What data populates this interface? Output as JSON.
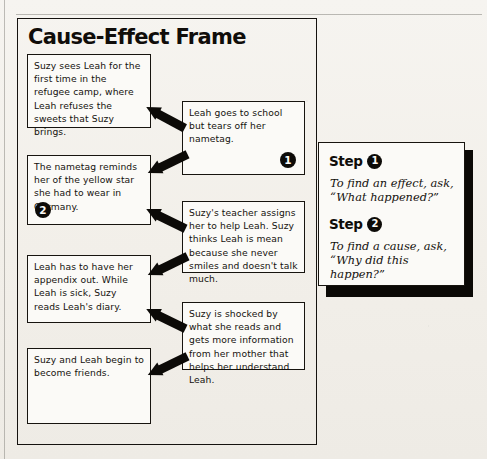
{
  "page": {
    "title": "Cause-Effect Frame"
  },
  "causes": [
    {
      "id": "cause-1",
      "text": "Suzy sees Leah for the first time in the refugee camp, where Leah refuses the sweets that Suzy brings.",
      "badge": ""
    },
    {
      "id": "cause-2",
      "text": "The nametag reminds her of the yellow star she had to wear in Germany.",
      "badge": "2"
    },
    {
      "id": "cause-3",
      "text": "Leah has to have her appendix out. While Leah is sick, Suzy reads Leah's diary.",
      "badge": ""
    },
    {
      "id": "cause-4",
      "text": "Suzy and Leah begin to become friends.",
      "badge": ""
    }
  ],
  "effects": [
    {
      "id": "effect-1",
      "text": "Leah goes to school but tears off her nametag.",
      "badge": "1"
    },
    {
      "id": "effect-2",
      "text": "Suzy's teacher assigns her to help Leah. Suzy thinks Leah is mean because she never smiles and doesn't talk much.",
      "badge": ""
    },
    {
      "id": "effect-3",
      "text": "Suzy is shocked by what she reads and gets more information from her mother that helps her understand Leah.",
      "badge": ""
    }
  ],
  "side_panel": {
    "steps": [
      {
        "label": "Step",
        "number": "1",
        "body": "To find an effect, ask, “What happened?”"
      },
      {
        "label": "Step",
        "number": "2",
        "body": "To find a cause, ask, “Why did this happen?”"
      }
    ]
  },
  "colors": {
    "ink": "#0d0b08",
    "paper": "#f4f2ee",
    "box_fill": "#fbfaf7"
  },
  "icons": {
    "arrow": "block-arrow-right"
  }
}
